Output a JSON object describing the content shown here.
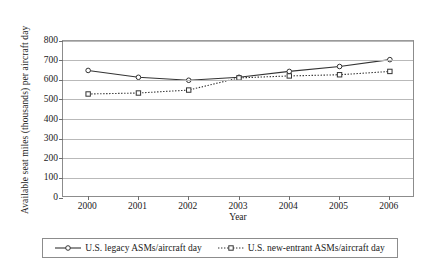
{
  "chart_data": {
    "type": "line",
    "title": "",
    "xlabel": "Year",
    "ylabel": "Available seat miles (thousands) per aircraft day",
    "categories": [
      "2000",
      "2001",
      "2002",
      "2003",
      "2004",
      "2005",
      "2006"
    ],
    "x": [
      2000,
      2001,
      2002,
      2003,
      2004,
      2005,
      2006
    ],
    "ylim": [
      0,
      800
    ],
    "yticks": [
      0,
      100,
      200,
      300,
      400,
      500,
      600,
      700,
      800
    ],
    "ytick_labels": [
      "0",
      "100",
      "200",
      "300",
      "400",
      "500",
      "600",
      "700",
      "800"
    ],
    "grid": "horizontal",
    "legend_position": "bottom",
    "series": [
      {
        "name": "U.S. legacy ASMs/aircraft day",
        "values": [
          650,
          615,
          600,
          615,
          645,
          670,
          705
        ],
        "line_style": "solid",
        "marker": "circle",
        "color": "#333333"
      },
      {
        "name": "U.S. new-entrant ASMs/aircraft day",
        "values": [
          530,
          535,
          550,
          612,
          622,
          628,
          645
        ],
        "line_style": "dotted",
        "marker": "square",
        "color": "#333333"
      }
    ]
  },
  "legend": {
    "entries": [
      {
        "label": "U.S. legacy ASMs/aircraft day"
      },
      {
        "label": "U.S. new-entrant ASMs/aircraft day"
      }
    ]
  }
}
